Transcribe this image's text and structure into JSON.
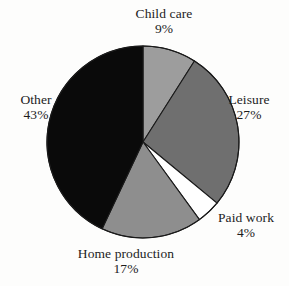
{
  "figure": {
    "background_color": "#fdfdfc",
    "text_color": "#1c1c1c"
  },
  "chart_data": {
    "type": "pie",
    "title": "",
    "subtitle": "",
    "xlabel": "",
    "ylabel": "",
    "legend_position": "none",
    "grid": false,
    "labels_inline": true,
    "start_angle_deg": 0,
    "direction": "clockwise",
    "center": {
      "x": 143,
      "y": 142
    },
    "radius": 96,
    "stroke_color": "#1a1a1a",
    "stroke_width": 1.1,
    "categories": [
      "Child care",
      "Leisure",
      "Paid work",
      "Home production",
      "Other"
    ],
    "values": [
      9,
      27,
      4,
      17,
      43
    ],
    "value_unit": "%",
    "colors": [
      "#9d9d9d",
      "#6f6f6f",
      "#ffffff",
      "#8e8e8e",
      "#0a0a0a"
    ],
    "slices": [
      {
        "name": "Child care",
        "value": 9,
        "value_label": "9%",
        "color": "#9d9d9d",
        "start_deg": 0,
        "end_deg": 32.4
      },
      {
        "name": "Leisure",
        "value": 27,
        "value_label": "27%",
        "color": "#6f6f6f",
        "start_deg": 32.4,
        "end_deg": 129.6
      },
      {
        "name": "Paid work",
        "value": 4,
        "value_label": "4%",
        "color": "#ffffff",
        "start_deg": 129.6,
        "end_deg": 144.0
      },
      {
        "name": "Home production",
        "value": 17,
        "value_label": "17%",
        "color": "#8e8e8e",
        "start_deg": 144.0,
        "end_deg": 205.2
      },
      {
        "name": "Other",
        "value": 43,
        "value_label": "43%",
        "color": "#0a0a0a",
        "start_deg": 205.2,
        "end_deg": 360.0
      }
    ]
  },
  "labels": {
    "child_care": {
      "name": "Child care",
      "value": "9%"
    },
    "leisure": {
      "name": "Leisure",
      "value": "27%"
    },
    "paid_work": {
      "name": "Paid work",
      "value": "4%"
    },
    "home_production": {
      "name": "Home production",
      "value": "17%"
    },
    "other": {
      "name": "Other",
      "value": "43%"
    }
  }
}
